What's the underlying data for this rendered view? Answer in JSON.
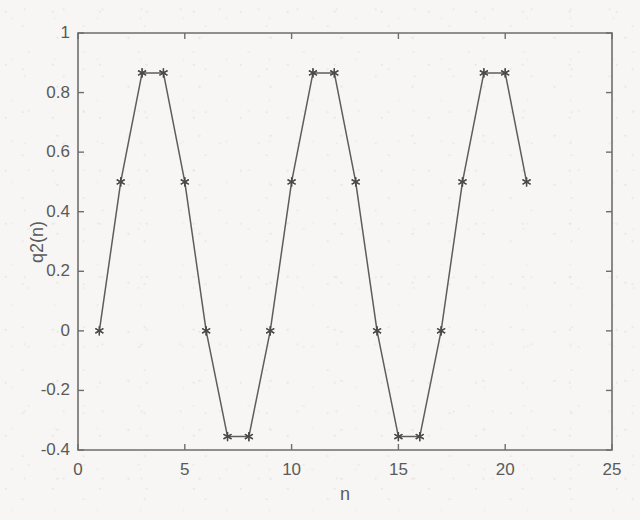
{
  "chart_data": {
    "type": "line",
    "title": "",
    "xlabel": "n",
    "ylabel": "q2(n)",
    "xlim": [
      0,
      25
    ],
    "ylim": [
      -0.4,
      1
    ],
    "grid": false,
    "legend": null,
    "marker": "asterisk",
    "line_color": "#5d5d5d",
    "marker_color": "#4a4a4a",
    "background_color": "#f7f6f4",
    "axis_color": "#6e6e6e",
    "xticks": [
      0,
      5,
      10,
      15,
      20,
      25
    ],
    "xtick_labels": [
      "0",
      "5",
      "10",
      "15",
      "20",
      "25"
    ],
    "yticks": [
      -0.4,
      -0.2,
      0,
      0.2,
      0.4,
      0.6,
      0.8,
      1
    ],
    "ytick_labels": [
      "-0.4",
      "-0.2",
      "0",
      "0.2",
      "0.4",
      "0.6",
      "0.8",
      "1"
    ],
    "x": [
      1,
      2,
      3,
      4,
      5,
      6,
      7,
      8,
      9,
      10,
      11,
      12,
      13,
      14,
      15,
      16,
      17,
      18,
      19,
      20,
      21
    ],
    "values": [
      0,
      0.5,
      0.866,
      0.866,
      0.5,
      0,
      -0.355,
      -0.355,
      0,
      0.5,
      0.866,
      0.866,
      0.5,
      0,
      -0.355,
      -0.355,
      0,
      0.5,
      0.866,
      0.866,
      0.5
    ],
    "series": [
      {
        "name": "q2(n)",
        "values": [
          0,
          0.5,
          0.866,
          0.866,
          0.5,
          0,
          -0.355,
          -0.355,
          0,
          0.5,
          0.866,
          0.866,
          0.5,
          0,
          -0.355,
          -0.355,
          0,
          0.5,
          0.866,
          0.866,
          0.5
        ]
      }
    ]
  }
}
